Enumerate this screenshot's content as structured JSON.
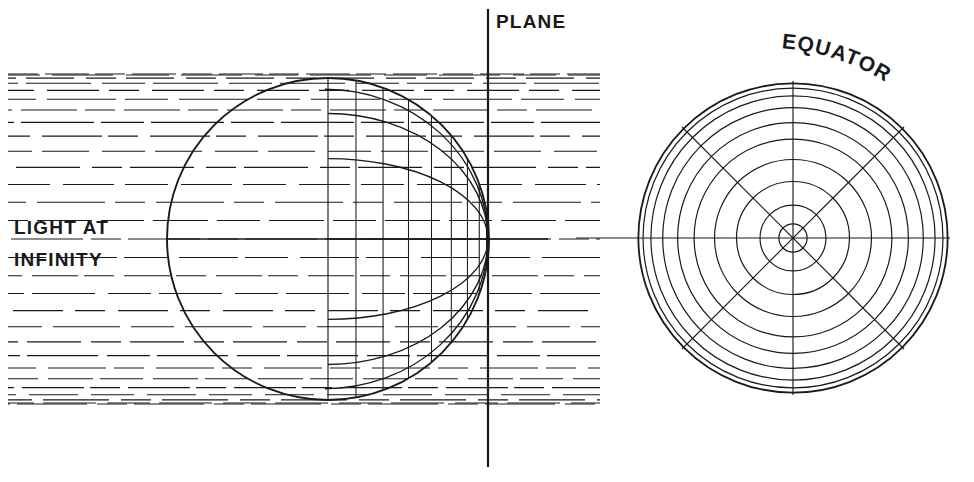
{
  "figure": {
    "background_color": "#ffffff",
    "ink_color": "#1a1a1a",
    "width": 974,
    "height": 482
  },
  "labels": {
    "plane": "PLANE",
    "equator": "EQUATOR",
    "light_line_1": "LIGHT AT",
    "light_line_2": "INFINITY"
  },
  "chart_data": {
    "type": "diagram",
    "annotations": [
      "PLANE",
      "EQUATOR",
      "LIGHT AT",
      "INFINITY"
    ],
    "plane_line": {
      "x": 488,
      "y_top": 10,
      "y_bottom": 466,
      "stroke_width": 2.2
    },
    "sphere_side_view": {
      "center_x": 328,
      "center_y": 239,
      "radius": 161,
      "tangent_point_x": 488,
      "tangent_point_y": 239,
      "meridian_arc_offsets": [
        -1.0,
        -0.78,
        -0.5,
        0.0,
        0.5,
        0.78,
        1.0
      ],
      "meridian_chord_fractions": [
        -1.0,
        -0.6,
        -0.15,
        0.2,
        0.5,
        0.72,
        0.88,
        0.97
      ],
      "equator_line_y": 239
    },
    "sphere_polar_view": {
      "center_x": 793,
      "center_y": 238,
      "radius": 157,
      "ring_radius_fractions": [
        0.985,
        0.955,
        0.905,
        0.83,
        0.735,
        0.63,
        0.5,
        0.36,
        0.21,
        0.09
      ],
      "radial_line_angles_deg": [
        0,
        45,
        90,
        135
      ],
      "ring_count": 10
    },
    "light_rays": {
      "direction": "horizontal, left to right",
      "style": "long dashes",
      "x_start": 8,
      "x_end": 600,
      "count": 29,
      "spacing": "cosine spaced - dense near top and bottom, wide at center",
      "y_center": 239,
      "half_span": 165
    }
  }
}
